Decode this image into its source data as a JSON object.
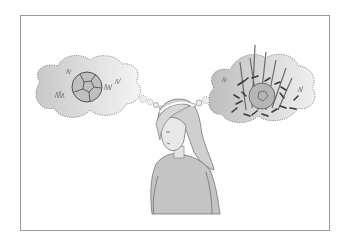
{
  "illustration": {
    "description": "Girl looking down imagining a ball in two thought bubbles",
    "left_bubble": "ball-in-short-grass",
    "right_bubble": "ball-hidden-in-tall-weeds",
    "colors": {
      "frame_border": "#9a9a9a",
      "background": "#ffffff",
      "cloud_fill": "#d2d2d2",
      "line": "#555555"
    }
  }
}
